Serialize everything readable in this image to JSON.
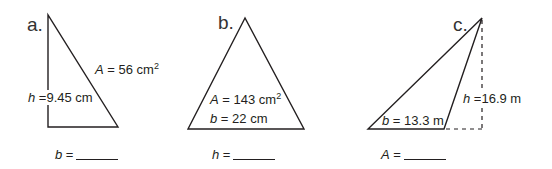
{
  "problems": [
    {
      "label": "a.",
      "area": {
        "var": "A",
        "eq": "=",
        "value": "56 cm",
        "sup": "2"
      },
      "height": {
        "var": "h",
        "eq": "=",
        "value": "9.45 cm"
      },
      "answer": {
        "var": "b",
        "eq": "="
      }
    },
    {
      "label": "b.",
      "area": {
        "var": "A",
        "eq": "=",
        "value": "143 cm",
        "sup": "2"
      },
      "base": {
        "var": "b",
        "eq": "=",
        "value": "22 cm"
      },
      "answer": {
        "var": "h",
        "eq": "="
      }
    },
    {
      "label": "c.",
      "height": {
        "var": "h",
        "eq": "=",
        "value": "16.9 m"
      },
      "base": {
        "var": "b",
        "eq": "=",
        "value": "13.3 m"
      },
      "answer": {
        "var": "A",
        "eq": "="
      }
    }
  ],
  "colors": {
    "stroke": "#231f20",
    "background": "#ffffff"
  }
}
